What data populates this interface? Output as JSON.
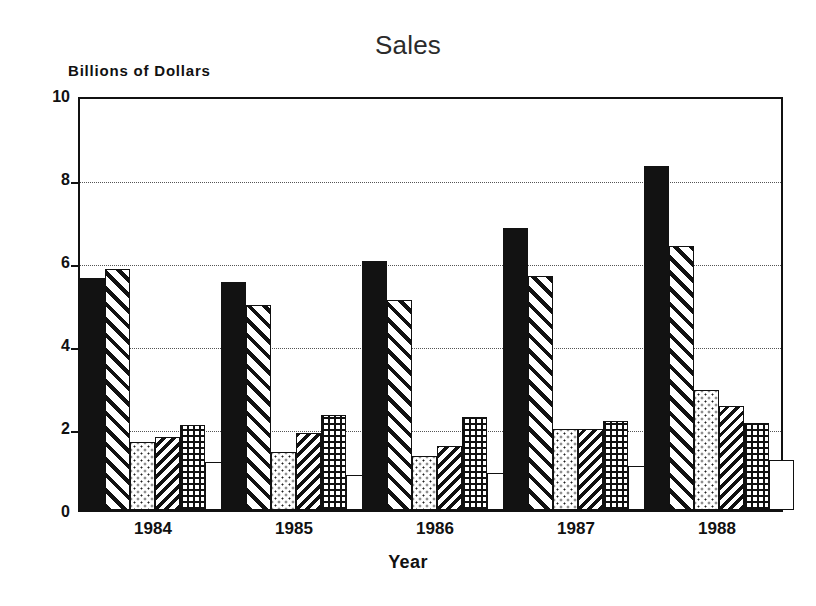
{
  "chart_data": {
    "type": "bar",
    "title": "Sales",
    "xlabel": "Year",
    "ylabel": "Billions of Dollars",
    "categories": [
      "1984",
      "1985",
      "1986",
      "1987",
      "1988"
    ],
    "ylim": [
      0,
      10
    ],
    "yticks": [
      0,
      2,
      4,
      6,
      8,
      10
    ],
    "ytick_labels": [
      "0",
      "2",
      "4",
      "6",
      "8",
      "10"
    ],
    "grid": true,
    "grid_axis": "y",
    "legend": "none",
    "series": [
      {
        "name": "Series 1",
        "pattern": "solid-black",
        "values": [
          5.6,
          5.5,
          6.0,
          6.8,
          8.3
        ]
      },
      {
        "name": "Series 2",
        "pattern": "diagonal-hatch",
        "values": [
          5.8,
          4.95,
          5.05,
          5.65,
          6.35
        ]
      },
      {
        "name": "Series 3",
        "pattern": "light-dots",
        "values": [
          1.65,
          1.4,
          1.3,
          1.95,
          2.9
        ]
      },
      {
        "name": "Series 4",
        "pattern": "dense-diagonal-hatch",
        "values": [
          1.75,
          1.85,
          1.55,
          1.95,
          2.5
        ]
      },
      {
        "name": "Series 5",
        "pattern": "cross-hatch",
        "values": [
          2.05,
          2.3,
          2.25,
          2.15,
          2.1
        ]
      },
      {
        "name": "Series 6",
        "pattern": "empty-white",
        "values": [
          1.15,
          0.85,
          0.9,
          1.05,
          1.2
        ]
      }
    ],
    "colors": {
      "foreground": "#111111",
      "background": "#ffffff",
      "gridline": "#555555",
      "title": "#2b2b2b"
    }
  }
}
